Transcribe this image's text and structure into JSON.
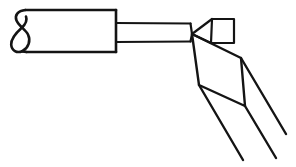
{
  "figure": {
    "domain": "line-drawing",
    "background_color": "#ffffff",
    "ink_color": "#141414",
    "canvas": {
      "width": 296,
      "height": 167
    }
  },
  "geometry": {
    "handle_body": {
      "label": "handle-body",
      "top_edge": {
        "x1": 24,
        "y1": 10,
        "x2": 116,
        "y2": 10
      },
      "bottom_edge": {
        "x1": 26,
        "y1": 52,
        "x2": 116,
        "y2": 52
      },
      "right_edge": {
        "x1": 116,
        "y1": 10,
        "x2": 116,
        "y2": 52
      },
      "path": "M 116 10 L 26 10"
    },
    "tail_curl": {
      "label": "tail-curl-loop",
      "path": "M 25.5 10 C 17 11.5 17.5 18 20 23 C 23 29 27 32 28 37 C 29.5 44 24 52.5 17.5 51.8 C 11.5 51.2 10.5 43 13.5 36.5 C 16.5 30 22 25.5 22 19.5 C 22 14.5 19.5 11.5 26 52"
    },
    "shaft": {
      "label": "shaft",
      "top_edge": {
        "x1": 116,
        "y1": 23,
        "x2": 190,
        "y2": 23
      },
      "bottom_edge": {
        "x1": 116,
        "y1": 42,
        "x2": 190,
        "y2": 42
      },
      "right_end": {
        "x": 191,
        "y": 33
      }
    },
    "pinch_vertex": {
      "label": "pinch-vertex",
      "x": 192,
      "y": 34
    },
    "tip_block": {
      "label": "tip-block",
      "corners": [
        {
          "x": 212,
          "y": 19
        },
        {
          "x": 234,
          "y": 19
        },
        {
          "x": 234,
          "y": 43
        },
        {
          "x": 211,
          "y": 43
        }
      ],
      "connector_top": {
        "x1": 192,
        "y1": 34,
        "x2": 212,
        "y2": 19
      },
      "connector_bottom": {
        "x1": 192,
        "y1": 34,
        "x2": 211,
        "y2": 43
      }
    },
    "parallelogram": {
      "label": "beam-parallelogram",
      "corners": [
        {
          "x": 192,
          "y": 34
        },
        {
          "x": 241,
          "y": 58
        },
        {
          "x": 245,
          "y": 106
        },
        {
          "x": 199,
          "y": 85
        }
      ]
    },
    "rays": [
      {
        "label": "ray-outer-left",
        "x1": 199,
        "y1": 85,
        "x2": 243,
        "y2": 160
      },
      {
        "label": "ray-middle",
        "x1": 241,
        "y1": 58,
        "x2": 286,
        "y2": 134
      },
      {
        "label": "ray-lower-right",
        "x1": 245,
        "y1": 106,
        "x2": 276,
        "y2": 158
      }
    ]
  },
  "labels": {
    "figure_caption": "",
    "reference_numerals": []
  }
}
